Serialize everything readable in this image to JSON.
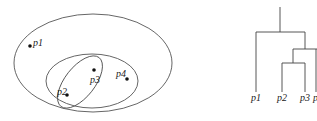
{
  "venn": {
    "points": [
      {
        "id": "p1",
        "label": "p1"
      },
      {
        "id": "p2",
        "label": "p2"
      },
      {
        "id": "p3",
        "label": "p3"
      },
      {
        "id": "p4",
        "label": "p4"
      }
    ]
  },
  "dendrogram": {
    "leaves": [
      "p1",
      "p2",
      "p3",
      "p4"
    ],
    "visible_leaf_labels": [
      "p1",
      "p2",
      "p3",
      "p"
    ]
  }
}
